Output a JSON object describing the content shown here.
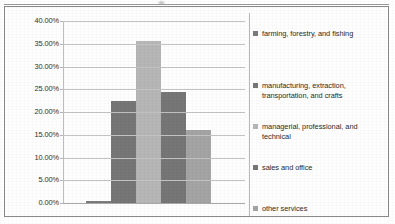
{
  "chart_data": {
    "type": "bar",
    "title": "",
    "xlabel": "",
    "ylabel": "",
    "categories": [
      "farming, forestry, and fishing",
      "manufacturing, extraction, transportation, and crafts",
      "managerial, professional, and technical",
      "sales and office",
      "other services"
    ],
    "values": [
      0.4,
      22.5,
      35.5,
      24.5,
      16.1
    ],
    "value_labels": [
      "0.40%",
      "22.50%",
      "35.50%",
      "24.50%",
      "16.10%"
    ],
    "ylim": [
      0,
      40
    ],
    "ytick_labels": [
      "40.00%",
      "35.00%",
      "30.00%",
      "25.00%",
      "20.00%",
      "15.00%",
      "10.00%",
      "5.00%",
      "0.00%"
    ],
    "ytick_values": [
      40,
      35,
      30,
      25,
      20,
      15,
      10,
      5,
      0
    ],
    "grid": true,
    "legend_position": "right",
    "series_colors": [
      "#7b7b7b",
      "#767676",
      "#b6b6b6",
      "#767676",
      "#a4a4a4"
    ]
  },
  "legend": {
    "items": [
      {
        "label": "farming, forestry, and fishing",
        "color": "#7b7b7b"
      },
      {
        "label": "manufacturing, extraction, transportation, and crafts",
        "color": "#767676"
      },
      {
        "label": "managerial, professional, and technical",
        "color": "#b6b6b6"
      },
      {
        "label": "sales and office",
        "color": "#767676"
      },
      {
        "label": "other services",
        "color": "#a4a4a4"
      }
    ]
  },
  "axis": {
    "y_labels": [
      "40.00%",
      "35.00%",
      "30.00%",
      "25.00%",
      "20.00%",
      "15.00%",
      "10.00%",
      "5.00%",
      "0.00%"
    ]
  }
}
